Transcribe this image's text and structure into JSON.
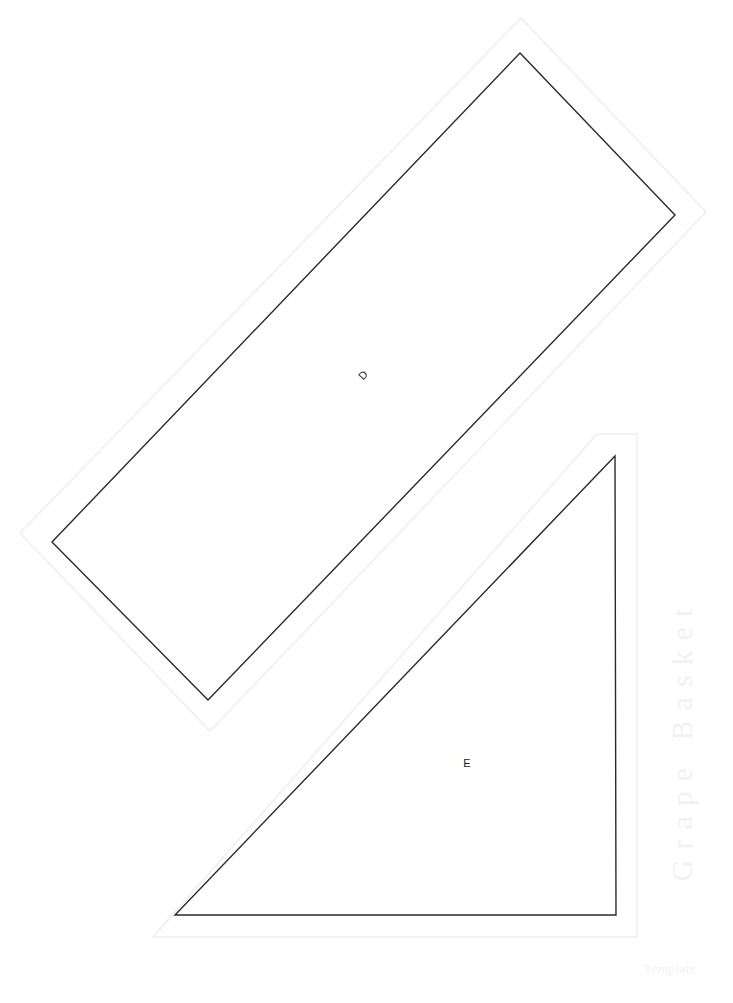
{
  "sheet": {
    "title": "Grape Basket Quilt Block Templates",
    "width": 733,
    "height": 1003,
    "background_color": "#ffffff",
    "cut_line_color": "#2a2a2e",
    "seam_line_color": "#f2f2f4",
    "watermark_color": "#f1f1f3",
    "label_color": "#1d1d21"
  },
  "watermark": {
    "side_text": "Grape Basket",
    "corner_text": "Template"
  },
  "pieces": [
    {
      "id": "piece-d",
      "label": "D",
      "shape": "rectangle",
      "rotation_deg": -46,
      "label_x": 363,
      "label_y": 376,
      "label_size": 11,
      "cut_points": "520,53 675,215 208,700 52,542",
      "seam_points": "521,18 706,212 210,731 20,533"
    },
    {
      "id": "piece-e",
      "label": "E",
      "shape": "right-triangle",
      "rotation_deg": 0,
      "label_x": 467,
      "label_y": 767,
      "label_size": 11,
      "cut_points": "615,456 616,915 175,915",
      "seam_points": "597,434 637,434 637,937 153,937"
    }
  ]
}
